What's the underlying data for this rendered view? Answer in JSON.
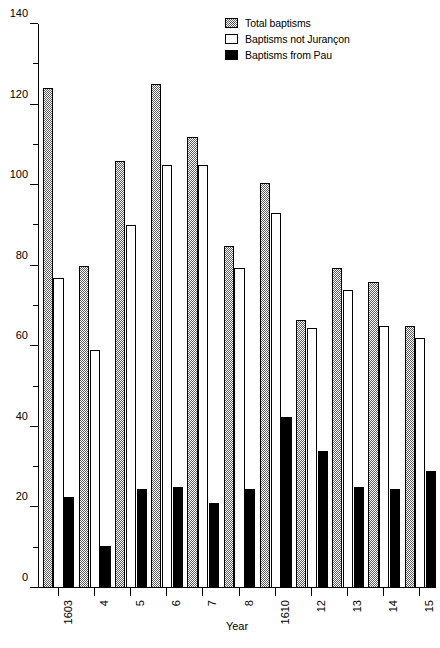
{
  "chart_data": {
    "type": "bar",
    "title": "",
    "subtitle": "",
    "xlabel": "Year",
    "ylabel": "",
    "ylim": [
      0,
      140
    ],
    "ytick_step": 20,
    "yminor_step": 10,
    "grid": false,
    "legend_position": "top-right",
    "categories": [
      "1603",
      "4",
      "5",
      "6",
      "7",
      "8",
      "1610",
      "12",
      "13",
      "14",
      "15"
    ],
    "ytick_labels": [
      "0",
      "20",
      "40",
      "60",
      "80",
      "100",
      "120",
      "140"
    ],
    "series": [
      {
        "name": "Total baptisms",
        "fill": "stipple",
        "values": [
          124,
          80,
          106,
          125,
          112,
          85,
          100.5,
          66.5,
          79.5,
          76,
          65
        ]
      },
      {
        "name": "Baptisms not Jurançon",
        "fill": "white",
        "values": [
          77,
          59,
          90,
          105,
          105,
          79.5,
          93,
          64.5,
          74,
          65,
          62
        ]
      },
      {
        "name": "Baptisms from Pau",
        "fill": "black",
        "values": [
          22.5,
          10.5,
          24.5,
          25,
          21,
          24.5,
          42.5,
          34,
          25,
          24.5,
          29
        ]
      }
    ]
  },
  "legend": {
    "items": [
      {
        "label": "Total baptisms",
        "swatch": "stipple-swatch"
      },
      {
        "label": "Baptisms not Jurançon",
        "swatch": "white-swatch"
      },
      {
        "label": "Baptisms from Pau",
        "swatch": "black-swatch"
      }
    ]
  },
  "axes": {
    "x_title": "Year"
  }
}
